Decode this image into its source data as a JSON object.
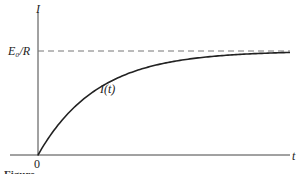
{
  "figure": {
    "y_axis_label": "I",
    "x_axis_label": "t",
    "asymptote_label": "E₀/R",
    "curve_label": "I(t)",
    "origin_label": "0",
    "caption_partial": "Figure"
  },
  "chart_data": {
    "type": "line",
    "title": "",
    "xlabel": "t",
    "ylabel": "I",
    "series": [
      {
        "name": "I(t)",
        "function": "(E0/R)(1 - e^(-t/tau))",
        "x": [
          0,
          0.5,
          1,
          1.5,
          2,
          3,
          4,
          5
        ],
        "y_fraction_of_asymptote": [
          0,
          0.39,
          0.63,
          0.78,
          0.86,
          0.95,
          0.98,
          0.99
        ]
      }
    ],
    "annotations": [
      {
        "type": "hline",
        "label": "E0/R",
        "style": "dashed",
        "y_fraction": 1.0
      }
    ],
    "origin": "0",
    "grid": false
  },
  "colors": {
    "ink": "#222222",
    "dash": "#777777"
  }
}
